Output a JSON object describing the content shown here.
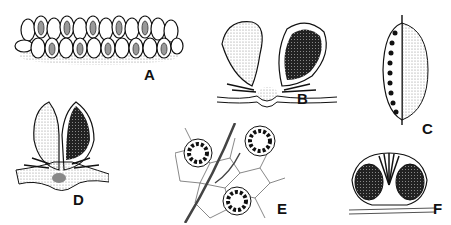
{
  "figure": {
    "panels": [
      {
        "id": "A",
        "label": "A",
        "subject": "row of overlapping sori/indusia along a leaf margin"
      },
      {
        "id": "B",
        "label": "B",
        "subject": "pair of sporangia/indusia on a vein, one open (stippled), one dark"
      },
      {
        "id": "C",
        "label": "C",
        "subject": "elongate sorus with a marginal row of dark dots along a vein"
      },
      {
        "id": "D",
        "label": "D",
        "subject": "two-lobed indusium, left stippled and right dark, on a vein"
      },
      {
        "id": "E",
        "label": "E",
        "subject": "three round radial sori on a polygonal cell network with veins"
      },
      {
        "id": "F",
        "label": "F",
        "subject": "round capsule cross-section with two dark chambers and central radiating structure"
      }
    ],
    "colors": {
      "ink": "#111111",
      "stipple": "#9a9a9a",
      "dark_fill": "#2a2a2a",
      "background": "#ffffff"
    }
  }
}
